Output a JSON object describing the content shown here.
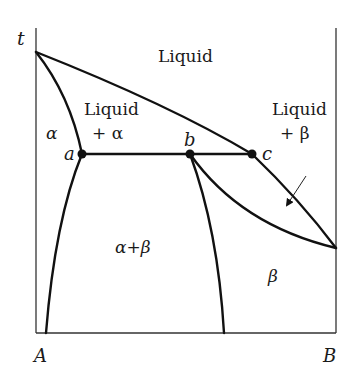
{
  "diagram": {
    "type": "binary eutectic phase diagram (peritectic-like with limited solubility)",
    "axis": {
      "y_label": "t",
      "x_left_label": "A",
      "x_right_label": "B"
    },
    "regions": {
      "liquid": "Liquid",
      "liquid_alpha_line1": "Liquid",
      "liquid_alpha_line2": "+ α",
      "alpha": "α",
      "alpha_beta": "α+β",
      "liquid_beta_line1": "Liquid",
      "liquid_beta_line2": "+ β",
      "beta": "β"
    },
    "points": {
      "a": "a",
      "b": "b",
      "c": "c"
    },
    "colors": {
      "line": "#111111",
      "axis": "#333333",
      "background": "#ffffff"
    }
  }
}
